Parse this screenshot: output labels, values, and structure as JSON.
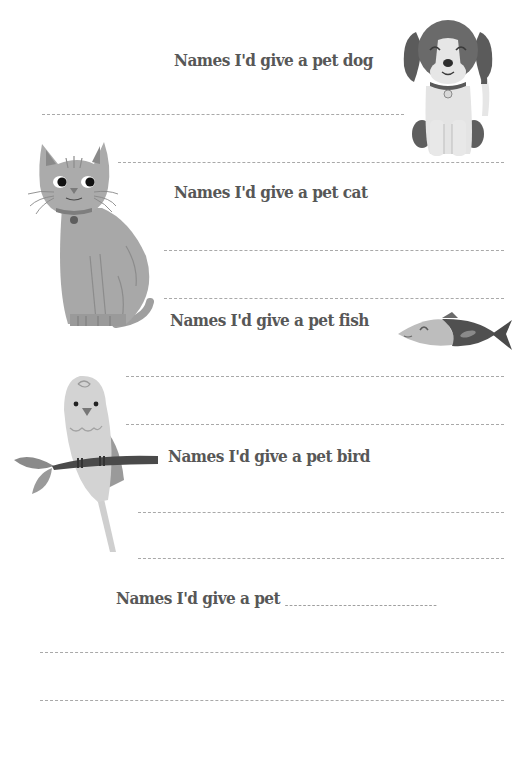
{
  "sections": [
    {
      "id": "dog",
      "heading": "Names I'd give a pet dog",
      "illustration": "dog-illustration"
    },
    {
      "id": "cat",
      "heading": "Names I'd give a pet cat",
      "illustration": "cat-illustration"
    },
    {
      "id": "fish",
      "heading": "Names I'd give a pet fish",
      "illustration": "fish-illustration"
    },
    {
      "id": "bird",
      "heading": "Names I'd give a pet bird",
      "illustration": "parrot-illustration"
    },
    {
      "id": "custom",
      "heading": "Names I'd give a pet",
      "illustration": null
    }
  ],
  "colors": {
    "text": "#575757",
    "dash_line": "#a9a9a9",
    "dog_dark": "#5e5e5e",
    "dog_light": "#e4e4e4",
    "cat_body": "#a9a9a9",
    "fish_dark": "#505050",
    "fish_light": "#bdbdbd",
    "bird_body": "#d2d2d2",
    "branch": "#4a4a4a",
    "leaf": "#8c8c8c"
  }
}
